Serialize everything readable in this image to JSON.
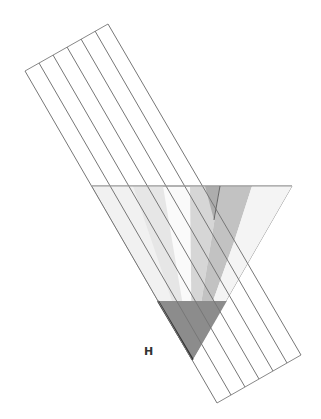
{
  "diagram": {
    "type": "geometric-strip-diagram",
    "label_h": "H",
    "band": {
      "strip_count": 6,
      "line_color": "#888888",
      "top_edge": [
        [
          25,
          71
        ],
        [
          108,
          24
        ]
      ],
      "bottom_edge": [
        [
          217,
          403
        ],
        [
          301,
          355
        ]
      ]
    },
    "large_triangle": {
      "points": [
        [
          92,
          186
        ],
        [
          292,
          186
        ],
        [
          192,
          360
        ]
      ],
      "stroke": "#999999"
    },
    "shaded_strips": [
      {
        "name": "strip-1",
        "fill": "#f0f0f0"
      },
      {
        "name": "strip-2",
        "fill": "#e2e2e2"
      },
      {
        "name": "strip-3",
        "fill": "#d4d4d4"
      },
      {
        "name": "strip-4",
        "fill": "#bdbdbd"
      },
      {
        "name": "strip-5",
        "fill": "#a8a8a8"
      }
    ],
    "dark_triangle": {
      "points": [
        [
          158,
          301
        ],
        [
          228,
          301
        ],
        [
          193,
          360
        ]
      ],
      "fill": "#8a8a8a"
    }
  }
}
